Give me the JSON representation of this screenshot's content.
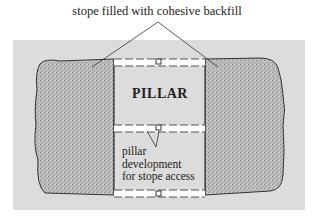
{
  "diagram": {
    "title_label": "stope filled with cohesive backfill",
    "pillar_label": "PILLAR",
    "development_label_lines": [
      "pillar",
      "development",
      "for stope access"
    ],
    "colors": {
      "background": "#dcdcdc",
      "backfill": "#b8b8b8",
      "outline": "#333333",
      "drift": "#ffffff",
      "text": "#222222"
    },
    "elements": [
      "left stope (backfilled)",
      "right stope (backfilled)",
      "pillar",
      "upper drift",
      "middle drift",
      "lower drift"
    ]
  }
}
